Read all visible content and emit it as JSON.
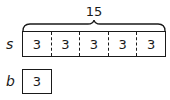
{
  "diagram": {
    "total_label": "15",
    "strip_s": {
      "label": "s",
      "cells": [
        "3",
        "3",
        "3",
        "3",
        "3"
      ]
    },
    "strip_b": {
      "label": "b",
      "cells": [
        "3"
      ]
    }
  }
}
